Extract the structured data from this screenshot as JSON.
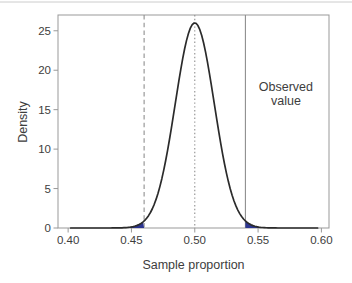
{
  "chart_data": {
    "type": "area",
    "title": "",
    "xlabel": "Sample proportion",
    "ylabel": "Density",
    "xlim": [
      0.392,
      0.606
    ],
    "ylim": [
      0,
      27
    ],
    "grid": false,
    "x_tick_values": [
      0.4,
      0.45,
      0.5,
      0.55,
      0.6
    ],
    "x_tick_labels": [
      "0.40",
      "0.45",
      "0.50",
      "0.55",
      "0.60"
    ],
    "y_tick_values": [
      0,
      5,
      10,
      15,
      20,
      25
    ],
    "y_tick_labels": [
      "0",
      "5",
      "10",
      "15",
      "20",
      "25"
    ],
    "curve": {
      "distribution": "normal-density",
      "mean": 0.5,
      "sd": 0.0154,
      "peak_density": 26
    },
    "curve_points": {
      "x": [
        0.4,
        0.41,
        0.42,
        0.43,
        0.44,
        0.45,
        0.46,
        0.47,
        0.48,
        0.49,
        0.5,
        0.51,
        0.52,
        0.53,
        0.54,
        0.55,
        0.56,
        0.57,
        0.58,
        0.59,
        0.6
      ],
      "density": [
        0,
        0,
        0,
        0,
        0.01,
        0.13,
        0.89,
        3.9,
        11.2,
        21.1,
        26,
        21.1,
        11.2,
        3.9,
        0.89,
        0.13,
        0.01,
        0,
        0,
        0,
        0
      ]
    },
    "reference_lines": [
      {
        "x": 0.46,
        "style": "dashed",
        "name": "lower-cutoff-line"
      },
      {
        "x": 0.5,
        "style": "dotted",
        "name": "center-line"
      },
      {
        "x": 0.54,
        "style": "solid",
        "name": "observed-value-line"
      }
    ],
    "shaded_tails": [
      {
        "side": "lower",
        "cutoff": 0.46
      },
      {
        "side": "upper",
        "cutoff": 0.54
      }
    ],
    "annotation": {
      "lines": [
        "Observed",
        "value"
      ],
      "x": 0.572,
      "y": 17
    },
    "colors": {
      "curve": "#2b2b2b",
      "axis": "#999999",
      "reference": "#8f8f8f",
      "shade": "#2c3590",
      "text": "#3d3d3d",
      "background": "#ffffff",
      "top_edge": "#cccccc"
    }
  }
}
